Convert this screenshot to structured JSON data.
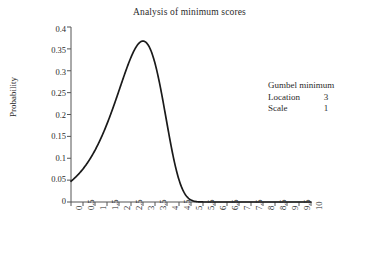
{
  "chart_data": {
    "type": "line",
    "title": "Analysis of minimum scores",
    "xlabel": "Customer satisfaction index (0–10 scale)",
    "ylabel": "Probability",
    "xlim": [
      0,
      10
    ],
    "ylim": [
      0,
      0.4
    ],
    "grid": false,
    "legend_position": "right-inside",
    "xticks": [
      "0",
      "0.5",
      "1",
      "1.5",
      "2",
      "2.5",
      "3",
      "3.5",
      "4",
      "4.5",
      "5",
      "5.5",
      "6",
      "6.5",
      "7",
      "7.5",
      "8",
      "8.5",
      "9",
      "9.5",
      "10"
    ],
    "yticks": [
      "0",
      "0.05",
      "0.1",
      "0.15",
      "0.2",
      "0.25",
      "0.3",
      "0.35",
      "0.4"
    ],
    "series": [
      {
        "name": "Gumbel minimum",
        "color": "#1a1a1a",
        "distribution": "gumbel-minimum",
        "location": 3,
        "scale": 1,
        "peak_x": 3.0,
        "peak_y": 0.3679,
        "x": [
          0,
          0.25,
          0.5,
          0.75,
          1,
          1.25,
          1.5,
          1.75,
          2,
          2.25,
          2.5,
          2.75,
          3,
          3.25,
          3.5,
          3.75,
          4,
          4.25,
          4.5,
          4.75,
          5,
          5.25,
          5.5,
          5.75,
          6,
          6.5,
          7,
          7.5,
          8,
          8.5,
          9,
          9.5,
          10
        ],
        "y": [
          0.0486,
          0.0608,
          0.0755,
          0.0928,
          0.1127,
          0.1351,
          0.1595,
          0.1851,
          0.2107,
          0.2346,
          0.2547,
          0.2687,
          0.274,
          0.2679,
          0.248,
          0.2129,
          0.1633,
          0.1036,
          0.0478,
          0.0113,
          0.0007,
          0.0,
          0.0,
          0.0,
          0.0,
          0.0,
          0.0,
          0.0,
          0.0,
          0.0,
          0.0,
          0.0,
          0.0
        ]
      }
    ],
    "annotations": {
      "legend_title": "Gumbel minimum",
      "rows": [
        {
          "key": "Location",
          "value": "3"
        },
        {
          "key": "Scale",
          "value": "1"
        }
      ]
    }
  },
  "axis": {
    "color": "#555555"
  }
}
